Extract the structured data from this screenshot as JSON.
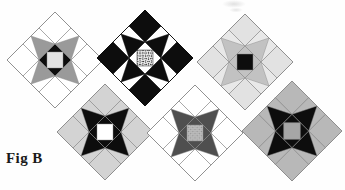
{
  "figure": {
    "label": "Fig B",
    "caption_position": "bottom-left",
    "background_color": "#fefefe",
    "width": 345,
    "height": 190,
    "artifact": {
      "name": "scan-smudge",
      "visible": true,
      "color": "#bdbdbd"
    }
  },
  "palette": {
    "black": "#0d0d0d",
    "dark_gray": "#4f4f4f",
    "mid_gray": "#9a9a9a",
    "light_gray": "#d3d3d3",
    "pale_gray": "#e2e2e2",
    "white": "#ffffff",
    "outline": "#8c8c8c",
    "speckle_dark": "#2b2b2b",
    "speckle_light": "#e8e8e8",
    "label_color": "#1a1a1a"
  },
  "blocks": [
    {
      "id": "block-1",
      "name": "variable-star-light-center",
      "position": {
        "cx": 55,
        "cy": 60,
        "half": 48,
        "rotation": 45
      },
      "corner_color": "#ffffff",
      "star_point_color": "#9a9a9a",
      "star_point_bg_color": "#ffffff",
      "center_color": "#e2e2e2",
      "center_frame_color": "#0d0d0d",
      "outline_color": "#8c8c8c",
      "center_texture": "solid"
    },
    {
      "id": "block-2",
      "name": "variable-star-black-speckled-center",
      "position": {
        "cx": 145,
        "cy": 58,
        "half": 48,
        "rotation": 45
      },
      "corner_color": "#0d0d0d",
      "star_point_color": "#0d0d0d",
      "star_point_bg_color": "#ffffff",
      "center_color": "#4f4f4f",
      "center_frame_color": "#ffffff",
      "outline_color": "#0d0d0d",
      "center_texture": "speckle"
    },
    {
      "id": "block-3",
      "name": "variable-star-hatched-points-black-center",
      "position": {
        "cx": 245,
        "cy": 62,
        "half": 48,
        "rotation": 45
      },
      "corner_color": "#e2e2e2",
      "star_point_color": "#c2c2c2",
      "star_point_bg_color": "#e8e8e8",
      "center_color": "#0d0d0d",
      "center_frame_color": "#c2c2c2",
      "outline_color": "#8c8c8c",
      "center_texture": "hatch"
    },
    {
      "id": "block-4",
      "name": "variable-star-black-points-white-center",
      "position": {
        "cx": 105,
        "cy": 132,
        "half": 48,
        "rotation": 45
      },
      "corner_color": "#d3d3d3",
      "star_point_color": "#0d0d0d",
      "star_point_bg_color": "#d3d3d3",
      "center_color": "#ffffff",
      "center_frame_color": "#0d0d0d",
      "outline_color": "#8c8c8c",
      "center_texture": "solid"
    },
    {
      "id": "block-5",
      "name": "variable-star-dark-gray-points-gray-center",
      "position": {
        "cx": 195,
        "cy": 133,
        "half": 48,
        "rotation": 45
      },
      "corner_color": "#ffffff",
      "star_point_color": "#4f4f4f",
      "star_point_bg_color": "#ffffff",
      "center_color": "#b0b0b0",
      "center_frame_color": "#4f4f4f",
      "outline_color": "#8c8c8c",
      "center_texture": "hatch"
    },
    {
      "id": "block-6",
      "name": "variable-star-pinwheel-black-points",
      "position": {
        "cx": 292,
        "cy": 131,
        "half": 50,
        "rotation": 45
      },
      "corner_color": "#b8b8b8",
      "star_point_color": "#0d0d0d",
      "star_point_bg_color": "#b8b8b8",
      "center_color": "#a6a6a6",
      "center_frame_color": "#0d0d0d",
      "outline_color": "#8c8c8c",
      "center_texture": "solid"
    }
  ]
}
